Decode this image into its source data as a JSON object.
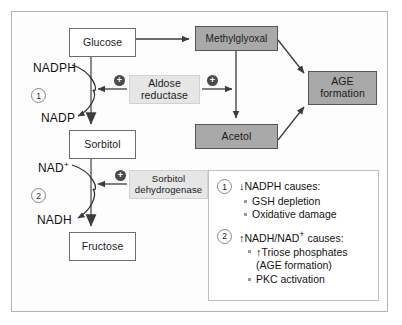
{
  "figure": {
    "nodes": {
      "glucose": "Glucose",
      "sorbitol": "Sorbitol",
      "fructose": "Fructose",
      "methylglyoxal": "Methylglyoxal",
      "acetol": "Acetol",
      "age_formation_line1": "AGE",
      "age_formation_line2": "formation",
      "aldose_reductase_line1": "Aldose",
      "aldose_reductase_line2": "reductase",
      "sorbitol_dehydrogenase_line1": "Sorbitol",
      "sorbitol_dehydrogenase_line2": "dehydrogenase"
    },
    "cofactors": {
      "nadph": "NADPH",
      "nadp": "NADP",
      "nad_plus_base": "NAD",
      "nad_plus_sup": "+",
      "nadh": "NADH"
    },
    "step_markers": {
      "step_1": "1",
      "step_2": "2"
    },
    "plus_badges": {
      "aldose_left": "+",
      "aldose_right": "+",
      "sorbitol_dehydrogenase": "+"
    },
    "colors": {
      "product_box": "#a9a9a9",
      "enzyme_box": "#e6e6e6",
      "metabolite_box": "#ffffff",
      "plus_badge": "#4a4a4a",
      "frame_border": "#b4b4b4",
      "arrow": "#3c3c3c"
    }
  },
  "legend": {
    "entries": [
      {
        "number": "1",
        "arrow": "↓",
        "heading": "NADPH causes:",
        "bullets": [
          "GSH depletion",
          "Oxidative damage"
        ]
      },
      {
        "number": "2",
        "arrow": "↑",
        "heading_base": "NADH/NAD",
        "heading_sup": "+",
        "heading_tail": " causes:",
        "bullet_1_arrow": "↑",
        "bullet_1_text": "Triose phosphates",
        "bullet_1_cont": "(AGE formation)",
        "bullet_2_text": "PKC activation"
      }
    ]
  }
}
